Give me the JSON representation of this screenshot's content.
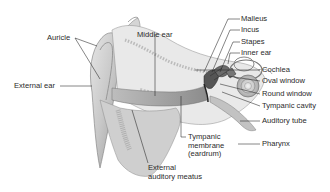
{
  "diagram": {
    "labels": {
      "auricle": "Auricle",
      "external_ear": "External ear",
      "middle_ear": "Middle ear",
      "malleus": "Malleus",
      "incus": "Incus",
      "stapes": "Stapes",
      "inner_ear": "Inner ear",
      "cochlea": "Cochlea",
      "oval_window": "Oval window",
      "round_window": "Round window",
      "tympanic_cavity": "Tympanic cavity",
      "auditory_tube": "Auditory tube",
      "pharynx": "Pharynx",
      "tympanic_membrane_line1": "Tympanic",
      "tympanic_membrane_line2": "membrane",
      "tympanic_membrane_line3": "(eardrum)",
      "external_auditory_meatus_line1": "External",
      "external_auditory_meatus_line2": "auditory meatus"
    }
  }
}
